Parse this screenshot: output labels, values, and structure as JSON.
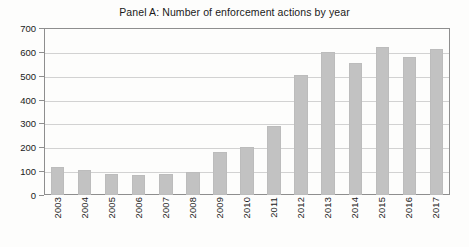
{
  "chart_data": {
    "type": "bar",
    "title": "Panel A: Number of enforcement actions by year",
    "xlabel": "",
    "ylabel": "",
    "categories": [
      "2003",
      "2004",
      "2005",
      "2006",
      "2007",
      "2008",
      "2009",
      "2010",
      "2011",
      "2012",
      "2013",
      "2014",
      "2015",
      "2016",
      "2017"
    ],
    "values": [
      118,
      103,
      88,
      84,
      86,
      96,
      182,
      202,
      290,
      505,
      600,
      555,
      622,
      578,
      612
    ],
    "ylim": [
      0,
      700
    ],
    "ytick_labels": [
      "0",
      "100",
      "200",
      "300",
      "400",
      "500",
      "600",
      "700"
    ],
    "ytick_values": [
      0,
      100,
      200,
      300,
      400,
      500,
      600,
      700
    ],
    "grid": true,
    "legend": false,
    "bar_color": "#c2c2c2",
    "axis_color": "#8e8e8e",
    "grid_color": "#d2d2d2",
    "text_color": "#1a1a1a",
    "background_color": "#fdfdfc"
  }
}
